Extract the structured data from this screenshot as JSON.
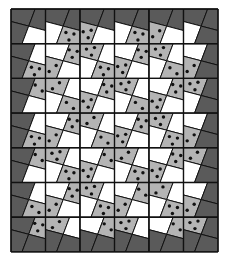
{
  "puzzle": {
    "rows": 7,
    "cols": 6,
    "colors": {
      "D": "#5a5a5a",
      "W": "#ffffff",
      "G": "#b4b4b4",
      "line": "#111111",
      "dot": "#111111"
    },
    "quadrant_order": [
      "top-left",
      "top-right",
      "bottom-left",
      "bottom-right"
    ],
    "legend": {
      "D": "dark border region",
      "W": "white region",
      "G2": "gray region with 2 dots",
      "G3": "gray region with 3 dots"
    },
    "grid": [
      [
        [
          "D",
          "D",
          "D",
          "W"
        ],
        [
          "D",
          "D",
          "W",
          "G3"
        ],
        [
          "D",
          "D",
          "G3",
          "W"
        ],
        [
          "D",
          "D",
          "W",
          "G3"
        ],
        [
          "D",
          "D",
          "G2",
          "W"
        ],
        [
          "D",
          "D",
          "W",
          "D"
        ]
      ],
      [
        [
          "D",
          "W",
          "D",
          "G3"
        ],
        [
          "W",
          "G3",
          "G2",
          "W"
        ],
        [
          "G3",
          "W",
          "W",
          "G3"
        ],
        [
          "W",
          "G3",
          "G3",
          "W"
        ],
        [
          "G3",
          "W",
          "W",
          "G2"
        ],
        [
          "W",
          "D",
          "G2",
          "D"
        ]
      ],
      [
        [
          "D",
          "G2",
          "D",
          "W"
        ],
        [
          "G2",
          "W",
          "W",
          "G2"
        ],
        [
          "W",
          "G3",
          "G3",
          "W"
        ],
        [
          "G3",
          "W",
          "W",
          "G2"
        ],
        [
          "W",
          "G3",
          "G3",
          "W"
        ],
        [
          "G3",
          "D",
          "W",
          "D"
        ]
      ],
      [
        [
          "D",
          "W",
          "D",
          "G3"
        ],
        [
          "W",
          "G3",
          "G2",
          "W"
        ],
        [
          "G2",
          "W",
          "W",
          "G2"
        ],
        [
          "W",
          "G3",
          "G3",
          "W"
        ],
        [
          "G3",
          "W",
          "W",
          "G3"
        ],
        [
          "W",
          "D",
          "G2",
          "D"
        ]
      ],
      [
        [
          "D",
          "G2",
          "D",
          "W"
        ],
        [
          "G3",
          "W",
          "W",
          "G3"
        ],
        [
          "W",
          "G2",
          "G3",
          "W"
        ],
        [
          "G2",
          "W",
          "W",
          "G3"
        ],
        [
          "W",
          "G3",
          "G3",
          "W"
        ],
        [
          "G2",
          "D",
          "W",
          "D"
        ]
      ],
      [
        [
          "D",
          "W",
          "D",
          "G2"
        ],
        [
          "W",
          "G3",
          "G2",
          "W"
        ],
        [
          "G3",
          "W",
          "W",
          "G3"
        ],
        [
          "W",
          "G2",
          "G2",
          "W"
        ],
        [
          "G2",
          "W",
          "W",
          "G3"
        ],
        [
          "W",
          "D",
          "G2",
          "D"
        ]
      ],
      [
        [
          "D",
          "G3",
          "D",
          "D"
        ],
        [
          "G2",
          "W",
          "D",
          "D"
        ],
        [
          "W",
          "G2",
          "D",
          "D"
        ],
        [
          "G3",
          "W",
          "D",
          "D"
        ],
        [
          "W",
          "G2",
          "D",
          "D"
        ],
        [
          "G3",
          "D",
          "D",
          "D"
        ]
      ]
    ]
  }
}
